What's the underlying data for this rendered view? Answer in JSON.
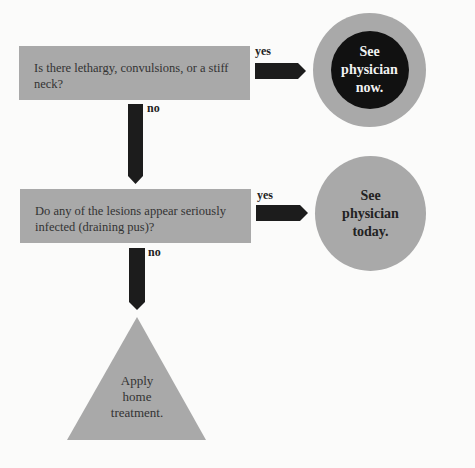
{
  "questions": [
    {
      "text": "Is there lethargy, convulsions, or a stiff neck?",
      "yes_label": "yes",
      "no_label": "no"
    },
    {
      "text": "Do any of the lesions appear seriously infected (draining pus)?",
      "yes_label": "yes",
      "no_label": "no"
    }
  ],
  "outcomes": {
    "urgent": {
      "lines": [
        "See",
        "physician",
        "now."
      ]
    },
    "soon": {
      "lines": [
        "See",
        "physician",
        "today."
      ]
    },
    "home": {
      "lines": [
        "Apply",
        "home",
        "treatment."
      ]
    }
  },
  "colors": {
    "box": "#a9a9a9",
    "arrow": "#1c1c1c",
    "circle_outer": "#a9a9a9",
    "circle_inner": "#111111"
  }
}
